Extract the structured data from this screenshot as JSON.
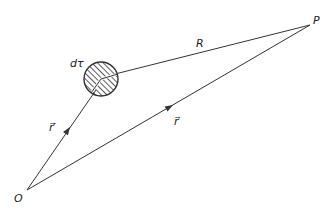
{
  "diagram": {
    "points": {
      "origin": {
        "label": "O",
        "x": 27,
        "y": 190
      },
      "field_point": {
        "label": "P",
        "x": 310,
        "y": 25
      },
      "source_center": {
        "x": 101,
        "y": 79
      }
    },
    "vectors": [
      {
        "name": "source-position",
        "label": "r⃗′",
        "from": "origin",
        "to": "source_center"
      },
      {
        "name": "field-position",
        "label": "r⃗",
        "from": "origin",
        "to": "field_point"
      },
      {
        "name": "separation",
        "label": "R",
        "from": "source_center",
        "to": "field_point"
      }
    ],
    "volume_element": {
      "label": "dτ",
      "radius": 17,
      "fill": "hatched"
    },
    "colors": {
      "line": "#333333",
      "background": "#ffffff"
    }
  }
}
